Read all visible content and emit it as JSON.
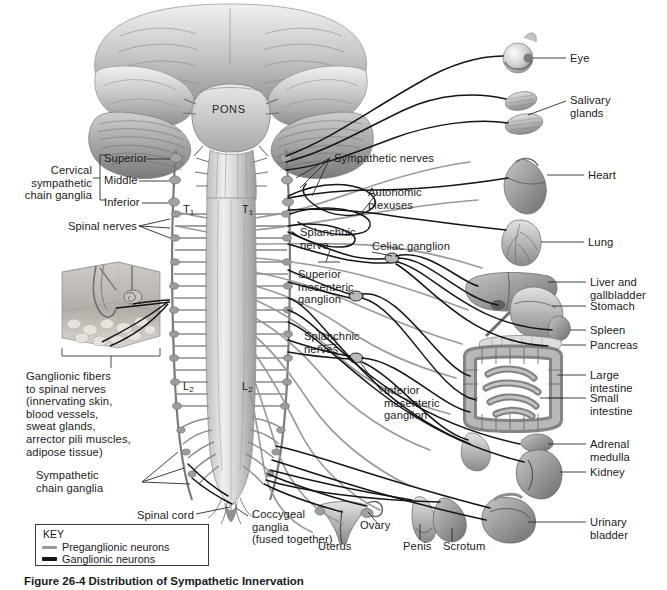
{
  "figure": {
    "caption_number": "Figure 26-4",
    "caption_title": "Distribution of Sympathetic Innervation",
    "pons_label": "PONS"
  },
  "segments": [
    {
      "name": "t1-left",
      "text": "T",
      "sub": "1"
    },
    {
      "name": "t1-right",
      "text": "T",
      "sub": "1"
    },
    {
      "name": "l2-left",
      "text": "L",
      "sub": "2"
    },
    {
      "name": "l2-right",
      "text": "L",
      "sub": "2"
    }
  ],
  "left_labels": {
    "cervical_chain": "Cervical\nsympathetic\nchain ganglia",
    "superior": "Superior",
    "middle": "Middle",
    "inferior": "Inferior",
    "spinal_nerves": "Spinal nerves",
    "ganglionic_fibers": "Ganglionic fibers\nto spinal nerves\n(innervating skin,\nblood vessels,\nsweat glands,\narrector pili muscles,\nadipose tissue)",
    "sympathetic_chain_ganglia": "Sympathetic\nchain ganglia",
    "spinal_cord": "Spinal cord"
  },
  "center_labels": {
    "sympathetic_nerves": "Sympathetic nerves",
    "autonomic_plexuses": "Autonomic\nplexuses",
    "splanchnic_nerve": "Splanchnic\nnerve",
    "celiac_ganglion": "Celiac ganglion",
    "superior_mesenteric_ganglion": "Superior\nmesenteric\nganglion",
    "splanchnic_nerves": "Splanchnic\nnerves",
    "inferior_mesenteric_ganglion": "Inferior\nmesenteric\nganglion",
    "coccygeal_ganglia": "Coccygeal\nganglia\n(fused together)"
  },
  "organ_labels": {
    "eye": "Eye",
    "salivary_glands": "Salivary\nglands",
    "heart": "Heart",
    "lung": "Lung",
    "liver_gallbladder": "Liver and\ngallbladder",
    "stomach": "Stomach",
    "spleen": "Spleen",
    "pancreas": "Pancreas",
    "large_intestine": "Large\nintestine",
    "small_intestine": "Small\nintestine",
    "adrenal_medulla": "Adrenal\nmedulla",
    "kidney": "Kidney",
    "urinary_bladder": "Urinary\nbladder",
    "uterus": "Uterus",
    "ovary": "Ovary",
    "penis": "Penis",
    "scrotum": "Scrotum"
  },
  "key": {
    "title": "KEY",
    "items": [
      {
        "label": "Preganglionic neurons",
        "color": "#9a9a9a",
        "style": "thin-gray"
      },
      {
        "label": "Ganglionic neurons",
        "color": "#141414",
        "style": "thick-black"
      }
    ]
  },
  "colors": {
    "background": "#ffffff",
    "label_text": "#1a1a1a",
    "preganglionic": "#9a9a9a",
    "ganglionic": "#141414",
    "leader_line": "#2a2a2a",
    "anatomy_light": "#d8d8d8",
    "anatomy_mid": "#9e9e9e",
    "anatomy_dark": "#5e5e5e"
  }
}
